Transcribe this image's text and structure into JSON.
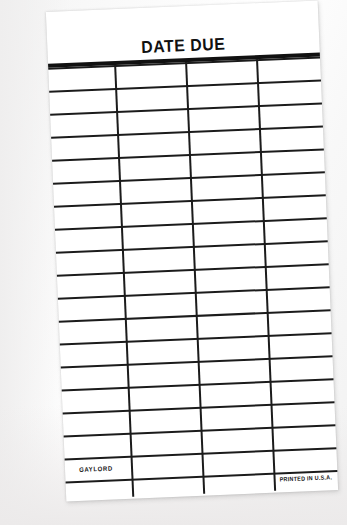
{
  "card": {
    "title": "DATE DUE",
    "publisher": "GAYLORD",
    "origin": "PRINTED IN U.S.A.",
    "paper_color": "#ffffff",
    "ink_color": "#1b1b1b",
    "backdrop_color": "#f4f4f4",
    "rotation_deg": -2.4,
    "grid": {
      "rows": 18,
      "columns": 4,
      "row_height_px": 23,
      "column_divider_x": [
        66,
        137,
        208
      ],
      "header_rule_thickness_px": 4,
      "line_thickness_px": 2
    }
  }
}
